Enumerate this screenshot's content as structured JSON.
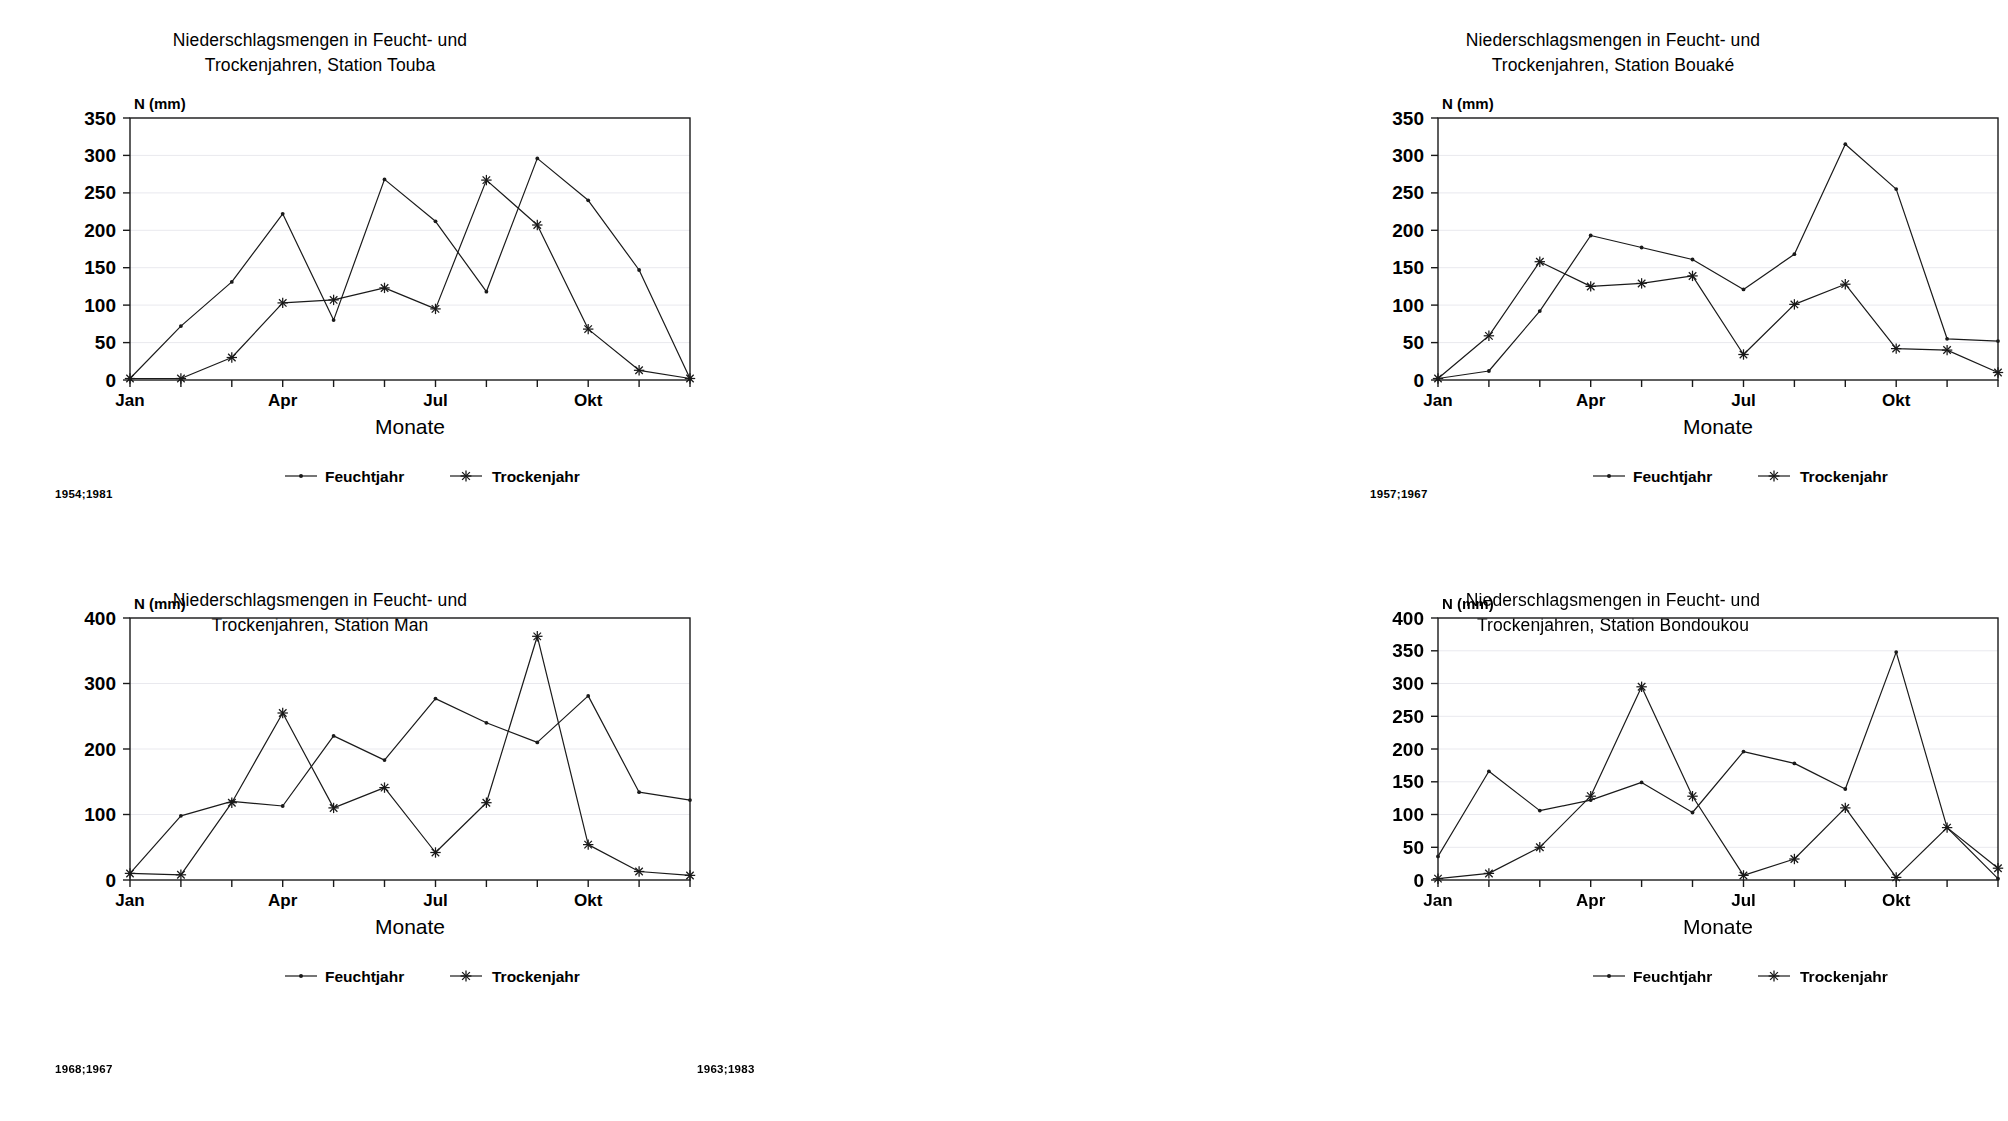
{
  "common": {
    "y_axis_label": "N (mm)",
    "x_axis_title": "Monate",
    "legend": [
      {
        "label": "Feuchtjahr",
        "marker": "dot-marker"
      },
      {
        "label": "Trockenjahr",
        "marker": "star-marker"
      }
    ],
    "x_tick_labels": [
      "Jan",
      "Apr",
      "Jul",
      "Okt"
    ],
    "months": [
      "Jan",
      "Feb",
      "Mrz",
      "Apr",
      "Mai",
      "Jun",
      "Jul",
      "Aug",
      "Sep",
      "Okt",
      "Nov",
      "Dez"
    ]
  },
  "panels": [
    {
      "id": "touba",
      "title": "Niederschlagsmengen in Feucht- und\nTrockenjahren, Station Touba",
      "footnote": "1954;1981"
    },
    {
      "id": "bouake",
      "title": "Niederschlagsmengen in Feucht- und\nTrockenjahren, Station Bouaké",
      "footnote": "1957;1967"
    },
    {
      "id": "man",
      "title": "Niederschlagsmengen in Feucht- und\nTrockenjahren, Station Man",
      "footnote": "1968;1967"
    },
    {
      "id": "bondoukou",
      "title": "Niederschlagsmengen in Feucht- und\nTrockenjahren, Station Bondoukou",
      "footnote": "1963;1983"
    }
  ],
  "chart_data": [
    {
      "type": "line",
      "title": "Niederschlagsmengen in Feucht- und Trockenjahren, Station Touba",
      "xlabel": "Monate",
      "ylabel": "N (mm)",
      "ylim": [
        0,
        350
      ],
      "yticks": [
        0,
        50,
        100,
        150,
        200,
        250,
        300,
        350
      ],
      "grid": true,
      "legend_position": "below",
      "categories": [
        "Jan",
        "Feb",
        "Mrz",
        "Apr",
        "Mai",
        "Jun",
        "Jul",
        "Aug",
        "Sep",
        "Okt",
        "Nov",
        "Dez"
      ],
      "series": [
        {
          "name": "Feuchtjahr",
          "marker": "dot",
          "values": [
            2,
            72,
            131,
            222,
            80,
            268,
            212,
            118,
            296,
            240,
            147,
            2
          ]
        },
        {
          "name": "Trockenjahr",
          "marker": "star",
          "values": [
            2,
            2,
            30,
            103,
            107,
            123,
            95,
            267,
            207,
            68,
            13,
            2
          ]
        }
      ],
      "footnote": "1954;1981"
    },
    {
      "type": "line",
      "title": "Niederschlagsmengen in Feucht- und Trockenjahren, Station Bouaké",
      "xlabel": "Monate",
      "ylabel": "N (mm)",
      "ylim": [
        0,
        350
      ],
      "yticks": [
        0,
        50,
        100,
        150,
        200,
        250,
        300,
        350
      ],
      "grid": true,
      "legend_position": "below",
      "categories": [
        "Jan",
        "Feb",
        "Mrz",
        "Apr",
        "Mai",
        "Jun",
        "Jul",
        "Aug",
        "Sep",
        "Okt",
        "Nov",
        "Dez"
      ],
      "series": [
        {
          "name": "Feuchtjahr",
          "marker": "dot",
          "values": [
            2,
            12,
            92,
            193,
            177,
            161,
            121,
            168,
            315,
            255,
            55,
            52
          ]
        },
        {
          "name": "Trockenjahr",
          "marker": "star",
          "values": [
            2,
            59,
            158,
            125,
            129,
            139,
            34,
            101,
            128,
            42,
            40,
            10
          ]
        }
      ],
      "footnote": "1957;1967"
    },
    {
      "type": "line",
      "title": "Niederschlagsmengen in Feucht- und Trockenjahren, Station Man",
      "xlabel": "Monate",
      "ylabel": "N (mm)",
      "ylim": [
        0,
        400
      ],
      "yticks": [
        0,
        100,
        200,
        300,
        400
      ],
      "grid": true,
      "legend_position": "below",
      "categories": [
        "Jan",
        "Feb",
        "Mrz",
        "Apr",
        "Mai",
        "Jun",
        "Jul",
        "Aug",
        "Sep",
        "Okt",
        "Nov",
        "Dez"
      ],
      "series": [
        {
          "name": "Feuchtjahr",
          "marker": "dot",
          "values": [
            10,
            98,
            120,
            113,
            220,
            183,
            277,
            240,
            210,
            281,
            134,
            122,
            30
          ]
        },
        {
          "name": "Trockenjahr",
          "marker": "star",
          "values": [
            10,
            8,
            118,
            255,
            110,
            141,
            42,
            118,
            372,
            54,
            13,
            7
          ]
        }
      ],
      "footnote": "1968;1967"
    },
    {
      "type": "line",
      "title": "Niederschlagsmengen in Feucht- und Trockenjahren, Station Bondoukou",
      "xlabel": "Monate",
      "ylabel": "N (mm)",
      "ylim": [
        0,
        400
      ],
      "yticks": [
        0,
        50,
        100,
        150,
        200,
        250,
        300,
        350,
        400
      ],
      "grid": true,
      "legend_position": "below",
      "categories": [
        "Jan",
        "Feb",
        "Mrz",
        "Apr",
        "Mai",
        "Jun",
        "Jul",
        "Aug",
        "Sep",
        "Okt",
        "Nov",
        "Dez"
      ],
      "series": [
        {
          "name": "Feuchtjahr",
          "marker": "dot",
          "values": [
            36,
            166,
            106,
            122,
            149,
            103,
            196,
            178,
            139,
            348,
            80,
            2
          ]
        },
        {
          "name": "Trockenjahr",
          "marker": "star",
          "values": [
            2,
            10,
            50,
            128,
            295,
            128,
            7,
            32,
            110,
            4,
            80,
            18
          ]
        }
      ],
      "footnote": "1963;1983"
    }
  ]
}
